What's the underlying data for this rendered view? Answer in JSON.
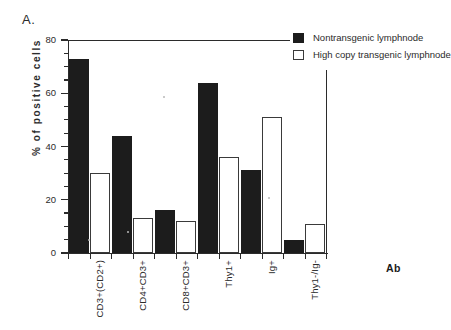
{
  "panel": {
    "label": "A."
  },
  "chart_data": {
    "type": "bar",
    "title": "",
    "subtitle": "",
    "xlabel": "Ab",
    "ylabel": "% of positive cells",
    "ylim": [
      0,
      80
    ],
    "yticks": [
      0,
      20,
      40,
      60,
      80
    ],
    "ytick_labels": [
      "0",
      "20",
      "40",
      "60",
      "80"
    ],
    "yminor_step": 5,
    "grid": false,
    "legend_position": "top-right",
    "categories": [
      "CD3+(CD2+)",
      "CD4+CD3+",
      "CD8+CD3+",
      "Thy1+",
      "Ig+",
      "Thy1-/Ig-"
    ],
    "series": [
      {
        "name": "Nontransgenic lymphnode",
        "color": "#1c1c1c",
        "style": "filled",
        "values": [
          73,
          44,
          16,
          64,
          31,
          5
        ]
      },
      {
        "name": "High copy transgenic lymphnode",
        "color": "#ffffff",
        "style": "open",
        "values": [
          30,
          13,
          12,
          36,
          51,
          11
        ]
      }
    ]
  }
}
